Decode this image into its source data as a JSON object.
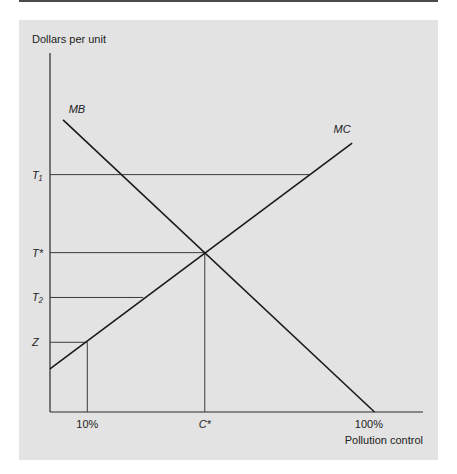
{
  "chart_data": {
    "type": "line",
    "title": "",
    "ylabel": "Dollars per unit",
    "xlabel": "Pollution control",
    "xlim": [
      0,
      100
    ],
    "ylim": [
      0,
      100
    ],
    "grid": false,
    "series": [
      {
        "name": "MB",
        "points": [
          [
            3.5,
            88
          ],
          [
            87,
            0
          ]
        ]
      },
      {
        "name": "MC",
        "points": [
          [
            0,
            13
          ],
          [
            81,
            81
          ]
        ]
      }
    ],
    "y_ticks": [
      {
        "label": "T₁",
        "value": 71.5
      },
      {
        "label": "T*",
        "value": 48
      },
      {
        "label": "T₂",
        "value": 34.5
      },
      {
        "label": "Z",
        "value": 21
      }
    ],
    "x_ticks": [
      {
        "label": "10%",
        "value": 10
      },
      {
        "label": "C*",
        "value": 41.5
      },
      {
        "label": "100%",
        "value": 85.5
      }
    ],
    "reference_lines": [
      {
        "name": "T1-line",
        "y": 71.5,
        "x_from": 0,
        "x_to": 69.5
      },
      {
        "name": "Tstar-line",
        "y": 48,
        "x_from": 0,
        "x_to": 41.5
      },
      {
        "name": "T2-line",
        "y": 34.5,
        "x_from": 0,
        "x_to": 25
      },
      {
        "name": "Z-line",
        "y": 21,
        "x_from": 0,
        "x_to": 10
      },
      {
        "name": "Cstar-vertical",
        "x": 41.5,
        "y_from": 0,
        "y_to": 48
      },
      {
        "name": "10pct-vertical",
        "x": 10,
        "y_from": 0,
        "y_to": 21
      }
    ],
    "curve_labels": [
      {
        "text": "MB",
        "x": 5,
        "y": 90
      },
      {
        "text": "MC",
        "x": 76,
        "y": 84
      }
    ]
  }
}
